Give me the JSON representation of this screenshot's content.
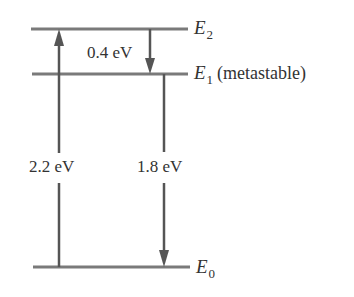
{
  "colors": {
    "line": "#6e6e6e",
    "text": "#333333",
    "background": "#ffffff"
  },
  "levels": [
    {
      "symbol": "E",
      "subscript": "2",
      "description": "",
      "y": 29
    },
    {
      "symbol": "E",
      "subscript": "1",
      "description": "(metastable)",
      "y": 74
    },
    {
      "symbol": "E",
      "subscript": "0",
      "description": "",
      "y": 267
    }
  ],
  "transitions": [
    {
      "label": "2.2 eV",
      "from": "E0",
      "to": "E2",
      "direction": "up"
    },
    {
      "label": "0.4 eV",
      "from": "E2",
      "to": "E1",
      "direction": "down"
    },
    {
      "label": "1.8 eV",
      "from": "E1",
      "to": "E0",
      "direction": "down"
    }
  ]
}
